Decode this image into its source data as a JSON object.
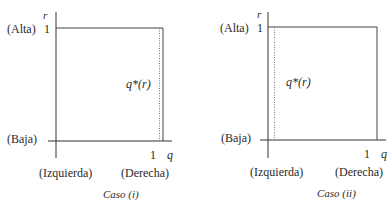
{
  "panels": [
    {
      "caption": "Caso (i)",
      "y_axis_var": "r",
      "x_axis_var": "q",
      "y_top_label": "(Alta)",
      "y_top_value": "1",
      "y_bottom_label": "(Baja)",
      "x_left_label": "(Izquierda)",
      "x_right_label": "(Derecha)",
      "x_right_value": "1",
      "curve_label": "q*(r)",
      "curve_position": "near q = 1 (right side)"
    },
    {
      "caption": "Caso (ii)",
      "y_axis_var": "r",
      "x_axis_var": "q",
      "y_top_label": "(Alta)",
      "y_top_value": "1",
      "y_bottom_label": "(Baja)",
      "x_left_label": "(Izquierda)",
      "x_right_label": "(Derecha)",
      "x_right_value": "1",
      "curve_label": "q*(r)",
      "curve_position": "near q = 0 (left side)"
    }
  ],
  "colors": {
    "line": "#333333",
    "dotted": "#777777",
    "text": "#2a2a2a"
  }
}
